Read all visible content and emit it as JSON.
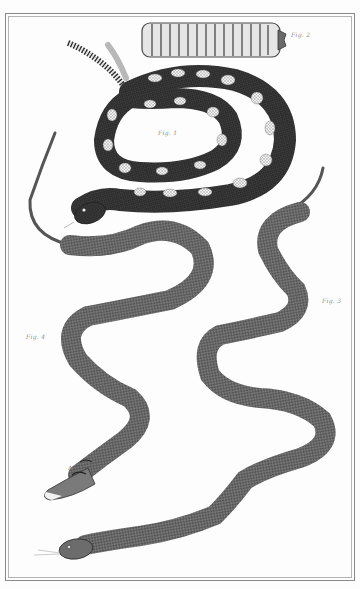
{
  "plate": {
    "description": "Engraved natural history plate of snakes: coiled rattlesnake, detached rattle, and two serpentine snakes",
    "colors": {
      "paper": "#fdfdfd",
      "ink_dark": "#2e2e2e",
      "ink_mid": "#6a6a6a",
      "ink_light": "#a8a8a8",
      "frame": "#8a8a8a"
    }
  },
  "figures": [
    {
      "id": "fig1",
      "label": "Fig. 1",
      "subject": "coiled rattlesnake with blotched pattern"
    },
    {
      "id": "fig2",
      "label": "Fig. 2",
      "subject": "rattle (segmented tail)"
    },
    {
      "id": "fig3",
      "label": "Fig. 3",
      "subject": "long serpentine snake, head at bottom left with forked tongue"
    },
    {
      "id": "fig4",
      "label": "Fig. 4",
      "subject": "serpentine snake with marked head"
    }
  ],
  "markers": [
    {
      "id": "marker-a",
      "text": "A"
    }
  ]
}
